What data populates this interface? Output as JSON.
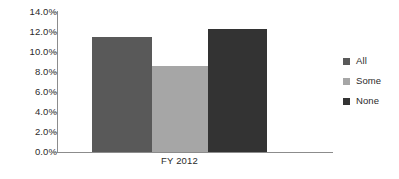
{
  "chart_data": {
    "type": "bar",
    "title": "",
    "subtitle": "",
    "xlabel": "",
    "ylabel": "",
    "categories": [
      "FY 2012"
    ],
    "series": [
      {
        "name": "All",
        "values": [
          11.5
        ],
        "color": "#595959"
      },
      {
        "name": "Some",
        "values": [
          8.6
        ],
        "color": "#a6a6a6"
      },
      {
        "name": "None",
        "values": [
          12.3
        ],
        "color": "#333333"
      }
    ],
    "ylim": [
      0.0,
      14.0
    ],
    "ytick_values": [
      0.0,
      2.0,
      4.0,
      6.0,
      8.0,
      10.0,
      12.0,
      14.0
    ],
    "ytick_labels": [
      "0.0%",
      "2.0%",
      "4.0%",
      "6.0%",
      "8.0%",
      "10.0%",
      "12.0%",
      "14.0%"
    ],
    "value_format": "percent",
    "grid": false,
    "legend_position": "right",
    "legend_entries": [
      "All",
      "Some",
      "None"
    ],
    "axis_color": "#8c8c8c",
    "text_color": "#2b2b2b",
    "background": "#ffffff",
    "annotations": []
  },
  "axis": {
    "y_ticks": [
      {
        "label": "14.0%",
        "value": 14.0
      },
      {
        "label": "12.0%",
        "value": 12.0
      },
      {
        "label": "10.0%",
        "value": 10.0
      },
      {
        "label": "8.0%",
        "value": 8.0
      },
      {
        "label": "6.0%",
        "value": 6.0
      },
      {
        "label": "4.0%",
        "value": 4.0
      },
      {
        "label": "2.0%",
        "value": 2.0
      },
      {
        "label": "0.0%",
        "value": 0.0
      }
    ],
    "x_categories": [
      "FY 2012"
    ]
  },
  "legend": {
    "items": [
      {
        "label": "All",
        "color": "#595959"
      },
      {
        "label": "Some",
        "color": "#a6a6a6"
      },
      {
        "label": "None",
        "color": "#333333"
      }
    ]
  }
}
